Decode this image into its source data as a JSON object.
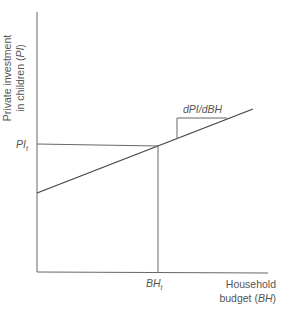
{
  "diagram": {
    "y_axis_label_line1": "Private investment",
    "y_axis_label_line2_prefix": "in children (",
    "y_axis_label_symbol": "PI",
    "y_axis_label_line2_suffix": ")",
    "x_axis_label_line1": "Household",
    "x_axis_label_line2_prefix": "budget (",
    "x_axis_label_symbol": "BH",
    "x_axis_label_line2_suffix": ")",
    "pi_tick_symbol": "PI",
    "pi_tick_subscript": "t",
    "bh_tick_symbol": "BH",
    "bh_tick_subscript": "t",
    "slope_label": "dPI/dBH",
    "colors": {
      "line": "#555555",
      "text": "#555555"
    }
  }
}
